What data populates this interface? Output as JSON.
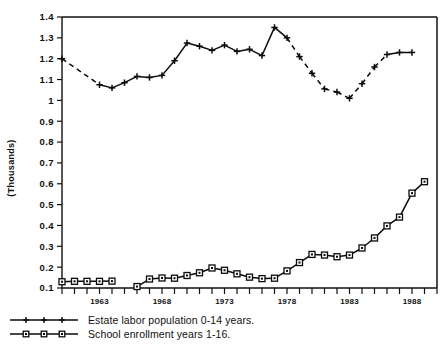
{
  "chart_data": {
    "type": "line",
    "title": "",
    "subtitle": "",
    "xlabel": "",
    "ylabel": "(Thousands)",
    "ylim": [
      0.1,
      1.4
    ],
    "xlim": [
      1960,
      1990
    ],
    "grid": false,
    "legend_position": "bottom-left",
    "yticks": [
      "1.4",
      "1.3",
      "1.2",
      "1.1",
      "1",
      "0.9",
      "0.8",
      "0.7",
      "0.6",
      "0.5",
      "0.4",
      "0.3",
      "0.2",
      "0.1"
    ],
    "ytick_values": [
      1.4,
      1.3,
      1.2,
      1.1,
      1.0,
      0.9,
      0.8,
      0.7,
      0.6,
      0.5,
      0.4,
      0.3,
      0.2,
      0.1
    ],
    "xticks_labeled": [
      "1963",
      "1968",
      "1973",
      "1978",
      "1983",
      "1988"
    ],
    "xtick_values_labeled": [
      1963,
      1968,
      1973,
      1978,
      1983,
      1988
    ],
    "xtick_values_all": [
      1960,
      1961,
      1962,
      1963,
      1964,
      1965,
      1966,
      1967,
      1968,
      1969,
      1970,
      1971,
      1972,
      1973,
      1974,
      1975,
      1976,
      1977,
      1978,
      1979,
      1980,
      1981,
      1982,
      1983,
      1984,
      1985,
      1986,
      1987,
      1988,
      1989,
      1990
    ],
    "series": [
      {
        "name": "Estate labor population 0-14 years.",
        "marker": "plus",
        "x": [
          1960,
          1963,
          1964,
          1965,
          1966,
          1967,
          1968,
          1969,
          1970,
          1971,
          1972,
          1973,
          1974,
          1975,
          1976,
          1977,
          1978,
          1979,
          1980,
          1981,
          1982,
          1983,
          1984,
          1985,
          1986,
          1987,
          1988
        ],
        "values": [
          1.2,
          1.075,
          1.06,
          1.085,
          1.115,
          1.11,
          1.12,
          1.19,
          1.275,
          1.26,
          1.24,
          1.265,
          1.235,
          1.245,
          1.215,
          1.35,
          1.3,
          1.21,
          1.13,
          1.055,
          1.04,
          1.01,
          1.08,
          1.16,
          1.22,
          1.23,
          1.23
        ],
        "dashed_segments": [
          [
            1960,
            1963
          ],
          [
            1978,
            1983
          ],
          [
            1983,
            1986
          ]
        ]
      },
      {
        "name": "School enrollment years 1-16.",
        "marker": "square",
        "x": [
          1960,
          1961,
          1962,
          1963,
          1964,
          1966,
          1967,
          1968,
          1969,
          1970,
          1971,
          1972,
          1973,
          1974,
          1975,
          1976,
          1977,
          1978,
          1979,
          1980,
          1981,
          1982,
          1983,
          1984,
          1985,
          1986,
          1987,
          1988,
          1989
        ],
        "values": [
          0.13,
          0.132,
          0.132,
          0.132,
          0.133,
          0.107,
          0.143,
          0.148,
          0.147,
          0.16,
          0.173,
          0.196,
          0.185,
          0.168,
          0.152,
          0.145,
          0.147,
          0.182,
          0.222,
          0.261,
          0.258,
          0.25,
          0.258,
          0.292,
          0.34,
          0.398,
          0.44,
          0.555,
          0.61
        ]
      }
    ],
    "legend": [
      {
        "label": "Estate labor population 0-14 years.",
        "marker": "plus"
      },
      {
        "label": "School enrollment years 1-16.",
        "marker": "square"
      }
    ]
  }
}
